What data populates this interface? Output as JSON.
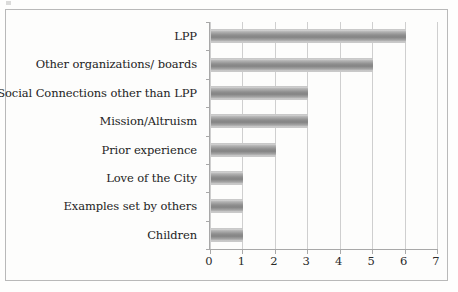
{
  "chart_data": {
    "type": "bar",
    "orientation": "horizontal",
    "title": "",
    "subtitle": "",
    "xlabel": "",
    "ylabel": "",
    "categories": [
      "LPP",
      "Other organizations/ boards",
      "Social Connections other than LPP",
      "Mission/Altruism",
      "Prior experience",
      "Love of the City",
      "Examples set by others",
      "Children"
    ],
    "values": [
      6,
      5,
      3,
      3,
      2,
      1,
      1,
      1
    ],
    "xlim": [
      0,
      7
    ],
    "xticks": [
      "0",
      "1",
      "2",
      "3",
      "4",
      "5",
      "6",
      "7"
    ],
    "xtick_values": [
      0,
      1,
      2,
      3,
      4,
      5,
      6,
      7
    ],
    "grid": "vertical",
    "legend": "none",
    "bar_color": "#8e8e8e",
    "gridline_color": "#cfcfcf",
    "axis_color": "#a8a8a8",
    "frame_color": "#b9b9b9",
    "background_color": "#fdfdfc",
    "text_color": "#232323"
  }
}
